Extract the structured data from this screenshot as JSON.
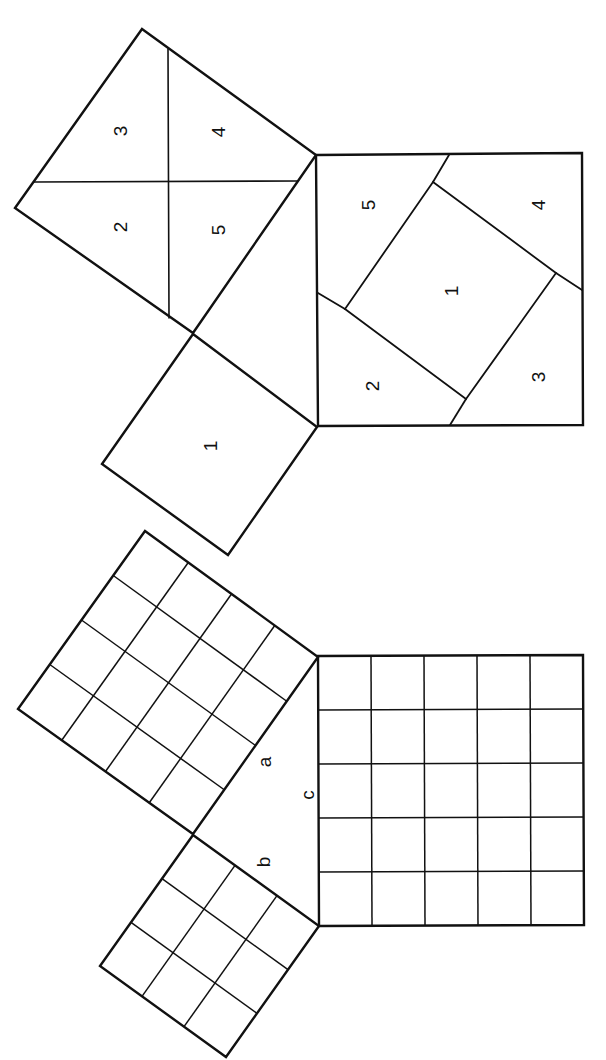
{
  "colors": {
    "stroke": "#111111",
    "background": "#ffffff"
  },
  "figures": [
    {
      "id": "dissection-proof",
      "description": "Pythagorean dissection: square on leg split into 4 pieces plus small square, rearranged into hypotenuse square",
      "polygons": [
        {
          "name": "leg-square-large",
          "points": [
            [
              142,
              29
            ],
            [
              316,
              155
            ],
            [
              193,
              333
            ],
            [
              15,
              208
            ]
          ],
          "width": 2.4
        },
        {
          "name": "leg-square-small",
          "points": [
            [
              193,
              334
            ],
            [
              317,
              427
            ],
            [
              228,
              555
            ],
            [
              102,
              464
            ]
          ],
          "width": 2.4
        },
        {
          "name": "hypotenuse-square",
          "points": [
            [
              316,
              155
            ],
            [
              582,
              153
            ],
            [
              583,
              425
            ],
            [
              318,
              426
            ]
          ],
          "width": 2.4
        },
        {
          "name": "inner-square-1",
          "points": [
            [
              433,
              182
            ],
            [
              556,
              273
            ],
            [
              466,
              399
            ],
            [
              345,
              309
            ]
          ],
          "width": 1.8
        }
      ],
      "lines": [
        {
          "name": "cut-vertical",
          "from": [
            168,
            49
          ],
          "to": [
            169,
            318
          ],
          "width": 1.6
        },
        {
          "name": "cut-horizontal",
          "from": [
            34,
            182
          ],
          "to": [
            298,
            181
          ],
          "width": 1.6
        },
        {
          "name": "inner-extension-top",
          "from": [
            433,
            182
          ],
          "to": [
            449,
            155
          ],
          "width": 1.8
        },
        {
          "name": "inner-extension-right",
          "from": [
            556,
            273
          ],
          "to": [
            582,
            290
          ],
          "width": 1.8
        },
        {
          "name": "inner-extension-bottom",
          "from": [
            466,
            399
          ],
          "to": [
            450,
            425
          ],
          "width": 1.8
        },
        {
          "name": "inner-extension-left",
          "from": [
            345,
            309
          ],
          "to": [
            318,
            293
          ],
          "width": 1.8
        }
      ],
      "labels": [
        {
          "name": "piece-3-left",
          "text": "3",
          "x": 120,
          "y": 131
        },
        {
          "name": "piece-4-left",
          "text": "4",
          "x": 218,
          "y": 132
        },
        {
          "name": "piece-2-left",
          "text": "2",
          "x": 120,
          "y": 227
        },
        {
          "name": "piece-5-left",
          "text": "5",
          "x": 218,
          "y": 230
        },
        {
          "name": "piece-1-left",
          "text": "1",
          "x": 210,
          "y": 446
        },
        {
          "name": "piece-5-right",
          "text": "5",
          "x": 368,
          "y": 205
        },
        {
          "name": "piece-4-right",
          "text": "4",
          "x": 538,
          "y": 205
        },
        {
          "name": "piece-1-right",
          "text": "1",
          "x": 451,
          "y": 291
        },
        {
          "name": "piece-2-right",
          "text": "2",
          "x": 372,
          "y": 386
        },
        {
          "name": "piece-3-right",
          "text": "3",
          "x": 538,
          "y": 377
        }
      ]
    },
    {
      "id": "grid-proof",
      "description": "3-4-5 right triangle with unit grid squares on each side",
      "grids": [
        {
          "name": "square-a-grid",
          "n": 4,
          "corners": [
            [
              145,
              531
            ],
            [
              318,
              657
            ],
            [
              193,
              834
            ],
            [
              18,
              709
            ]
          ]
        },
        {
          "name": "square-b-grid",
          "n": 3,
          "corners": [
            [
              193,
              835
            ],
            [
              319,
              926
            ],
            [
              226,
              1057
            ],
            [
              100,
              966
            ]
          ]
        },
        {
          "name": "square-c-grid",
          "n": 5,
          "corners": [
            [
              318,
              656
            ],
            [
              583,
              655
            ],
            [
              584,
              925
            ],
            [
              319,
              926
            ]
          ]
        }
      ],
      "labels": [
        {
          "name": "side-label-a",
          "text": "a",
          "x": 264,
          "y": 762
        },
        {
          "name": "side-label-c",
          "text": "c",
          "x": 307,
          "y": 795
        },
        {
          "name": "side-label-b",
          "text": "b",
          "x": 263,
          "y": 862
        }
      ]
    }
  ]
}
